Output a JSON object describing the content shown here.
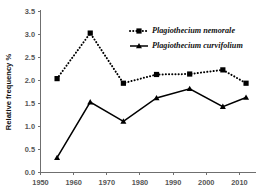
{
  "chart_data": {
    "type": "line",
    "title": "",
    "xlabel": "",
    "ylabel": "Relative frequency %",
    "xlim": [
      1950,
      2015
    ],
    "ylim": [
      0.0,
      3.5
    ],
    "grid": false,
    "legend_position": "top-right",
    "x": [
      1955,
      1965,
      1975,
      1985,
      1995,
      2005,
      2012
    ],
    "xticks": [
      "1950",
      "1960",
      "1970",
      "1980",
      "1990",
      "2000",
      "2010"
    ],
    "xtick_values": [
      1950,
      1960,
      1970,
      1980,
      1990,
      2000,
      2010
    ],
    "yticks": [
      "0.0",
      "0.5",
      "1.0",
      "1.5",
      "2.0",
      "2.5",
      "3.0",
      "3.5"
    ],
    "ytick_values": [
      0.0,
      0.5,
      1.0,
      1.5,
      2.0,
      2.5,
      3.0,
      3.5
    ],
    "series": [
      {
        "name": "Plagiothecium nemorale",
        "marker": "square",
        "linestyle": "dotted",
        "color": "#000000",
        "values": [
          2.03,
          3.02,
          1.93,
          2.12,
          2.13,
          2.22,
          1.93
        ]
      },
      {
        "name": "Plagiothecium curvifolium",
        "marker": "triangle",
        "linestyle": "solid",
        "color": "#000000",
        "values": [
          0.31,
          1.52,
          1.1,
          1.61,
          1.81,
          1.42,
          1.62
        ]
      }
    ]
  },
  "legend": {
    "items": [
      {
        "label": "Plagiothecium nemorale",
        "marker": "square",
        "linestyle": "dotted"
      },
      {
        "label": "Plagiothecium curvifolium",
        "marker": "triangle",
        "linestyle": "solid"
      }
    ]
  },
  "axes": {
    "y_title": "Relative frequency %"
  }
}
